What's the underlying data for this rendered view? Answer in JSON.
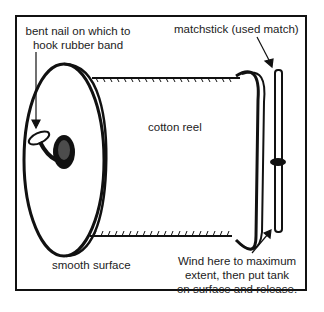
{
  "diagram": {
    "labels": {
      "nail_line1": "bent nail on which to",
      "nail_line2": "hook rubber band",
      "matchstick": "matchstick (used match)",
      "reel": "cotton reel",
      "surface": "smooth surface",
      "wind_line1": "Wind here to maximum",
      "wind_line2": "extent, then put tank",
      "wind_line3": "on surface and release."
    },
    "colors": {
      "ink": "#111111",
      "text": "#222222",
      "background": "#ffffff"
    }
  }
}
